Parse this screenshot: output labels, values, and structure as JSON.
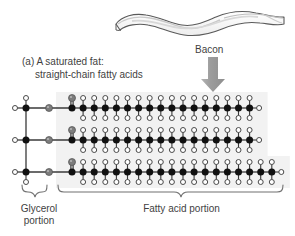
{
  "figure": {
    "caption_line1": "(a) A saturated fat:",
    "caption_line2": "straight-chain fatty acids",
    "bacon_label": "Bacon",
    "glycerol_label_line1": "Glycerol",
    "glycerol_label_line2": "portion",
    "fatty_acid_label": "Fatty acid portion",
    "icons": {
      "bacon": "bacon-strip-icon",
      "arrow": "down-arrow-icon",
      "glycerol_brace": "curly-brace-icon",
      "fatty_acid_brace": "curly-brace-icon"
    },
    "colors": {
      "carbon": "#111111",
      "oxygen": "#7d7d7d",
      "hydrogen_fill": "#ffffff",
      "hydrogen_stroke": "#4a4a4a",
      "bond": "#3a3a3a",
      "halo": "#f2f2f2",
      "text": "#3f3f3f",
      "arrow": "#9e9e9e",
      "bacon_outline": "#5a5a5a"
    }
  },
  "chart_data": {
    "type": "diagram",
    "title": "(a) A saturated fat: straight-chain fatty acids",
    "labels": [
      "Bacon",
      "Glycerol portion",
      "Fatty acid portion"
    ],
    "atom_legend": [
      {
        "name": "carbon",
        "render": "filled black circle"
      },
      {
        "name": "oxygen",
        "render": "filled gray circle"
      },
      {
        "name": "hydrogen",
        "render": "open white circle"
      }
    ],
    "structure": {
      "glycerol_backbone_carbons": 3,
      "ester_oxygens": 3,
      "chains": 3,
      "chain_rows": [
        {
          "row": 1,
          "carbonyl_carbons": 1,
          "carbonyl_oxygens": 1,
          "ch2_units": 15,
          "terminal_ch3": 1,
          "total_chain_carbons": 17
        },
        {
          "row": 2,
          "carbonyl_carbons": 1,
          "carbonyl_oxygens": 1,
          "ch2_units": 15,
          "terminal_ch3": 1,
          "total_chain_carbons": 17
        },
        {
          "row": 3,
          "carbonyl_carbons": 1,
          "carbonyl_oxygens": 1,
          "ch2_units": 17,
          "terminal_ch3": 1,
          "total_chain_carbons": 19
        }
      ],
      "bonds": "all single bonds (saturated)",
      "geometry": "straight chain"
    }
  }
}
